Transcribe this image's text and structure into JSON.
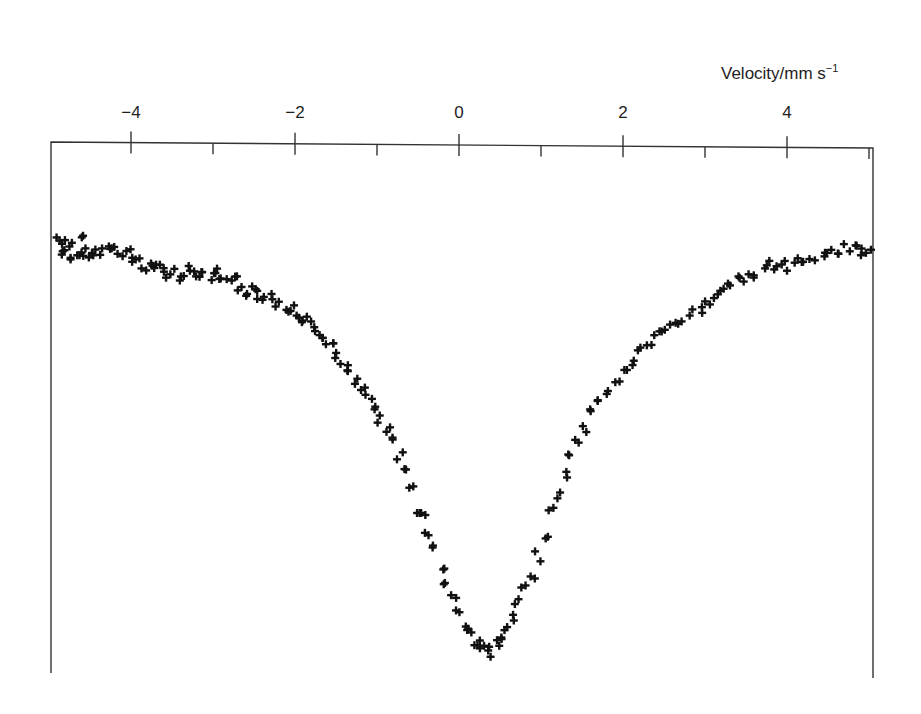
{
  "chart_data": {
    "type": "scatter",
    "title": "",
    "xlabel": "Velocity/mm s",
    "xlabel_superscript": "−1",
    "ylabel": "",
    "xlim": [
      -4.97,
      5.05
    ],
    "ylim_relative_transmission": [
      0.885,
      1.025
    ],
    "grid": false,
    "legend": null,
    "marker": "+",
    "x_ticks_major": [
      -4,
      -2,
      0,
      2,
      4
    ],
    "x_tick_labels": [
      "−4",
      "−2",
      "0",
      "2",
      "4"
    ],
    "x_ticks_minor": [
      -3,
      -1,
      1,
      3,
      5
    ],
    "x_axis_position": "top",
    "y_axis_labels": "none (relative transmission, arbitrary units)",
    "series": [
      {
        "name": "Mössbauer spectrum (single absorption line)",
        "points": [
          [
            -4.87,
            1.0
          ],
          [
            -4.8,
            1.0
          ],
          [
            -4.73,
            0.999
          ],
          [
            -4.6,
            1.0
          ],
          [
            -4.85,
            0.996
          ],
          [
            -4.78,
            0.996
          ],
          [
            -4.7,
            0.995
          ],
          [
            -4.62,
            0.996
          ],
          [
            -4.55,
            0.997
          ],
          [
            -4.48,
            0.996
          ],
          [
            -4.42,
            0.997
          ],
          [
            -4.35,
            0.997
          ],
          [
            -4.28,
            0.998
          ],
          [
            -4.2,
            0.997
          ],
          [
            -4.12,
            0.996
          ],
          [
            -4.05,
            0.997
          ],
          [
            -3.98,
            0.995
          ],
          [
            -3.92,
            0.994
          ],
          [
            -3.85,
            0.993
          ],
          [
            -3.78,
            0.994
          ],
          [
            -3.7,
            0.992
          ],
          [
            -3.62,
            0.993
          ],
          [
            -3.55,
            0.991
          ],
          [
            -3.48,
            0.992
          ],
          [
            -3.4,
            0.99
          ],
          [
            -3.32,
            0.991
          ],
          [
            -3.25,
            0.992
          ],
          [
            -3.18,
            0.991
          ],
          [
            -3.1,
            0.99
          ],
          [
            -3.02,
            0.99
          ],
          [
            -2.95,
            0.991
          ],
          [
            -2.88,
            0.989
          ],
          [
            -2.8,
            0.988
          ],
          [
            -2.72,
            0.989
          ],
          [
            -2.65,
            0.987
          ],
          [
            -2.58,
            0.986
          ],
          [
            -2.5,
            0.987
          ],
          [
            -2.42,
            0.985
          ],
          [
            -2.35,
            0.984
          ],
          [
            -2.28,
            0.985
          ],
          [
            -2.2,
            0.983
          ],
          [
            -2.12,
            0.981
          ],
          [
            -2.05,
            0.982
          ],
          [
            -1.98,
            0.98
          ],
          [
            -1.92,
            0.979
          ],
          [
            -1.85,
            0.978
          ],
          [
            -1.78,
            0.976
          ],
          [
            -1.7,
            0.974
          ],
          [
            -1.62,
            0.973
          ],
          [
            -1.55,
            0.971
          ],
          [
            -1.48,
            0.968
          ],
          [
            -1.4,
            0.966
          ],
          [
            -1.33,
            0.965
          ],
          [
            -1.25,
            0.962
          ],
          [
            -1.18,
            0.959
          ],
          [
            -1.1,
            0.957
          ],
          [
            -1.02,
            0.954
          ],
          [
            -0.95,
            0.951
          ],
          [
            -0.88,
            0.948
          ],
          [
            -0.8,
            0.945
          ],
          [
            -0.72,
            0.941
          ],
          [
            -0.65,
            0.937
          ],
          [
            -0.58,
            0.933
          ],
          [
            -0.5,
            0.927
          ],
          [
            -0.44,
            0.925
          ],
          [
            -0.38,
            0.921
          ],
          [
            -0.3,
            0.916
          ],
          [
            -0.22,
            0.911
          ],
          [
            -0.15,
            0.907
          ],
          [
            -0.08,
            0.903
          ],
          [
            0.0,
            0.899
          ],
          [
            0.08,
            0.895
          ],
          [
            0.14,
            0.893
          ],
          [
            0.2,
            0.891
          ],
          [
            0.26,
            0.89
          ],
          [
            0.33,
            0.889
          ],
          [
            0.4,
            0.888
          ],
          [
            0.46,
            0.89
          ],
          [
            0.52,
            0.891
          ],
          [
            0.58,
            0.894
          ],
          [
            0.66,
            0.897
          ],
          [
            0.73,
            0.901
          ],
          [
            0.8,
            0.905
          ],
          [
            0.88,
            0.909
          ],
          [
            0.96,
            0.914
          ],
          [
            1.05,
            0.92
          ],
          [
            1.14,
            0.926
          ],
          [
            1.22,
            0.931
          ],
          [
            1.3,
            0.936
          ],
          [
            1.38,
            0.941
          ],
          [
            1.46,
            0.945
          ],
          [
            1.55,
            0.949
          ],
          [
            1.64,
            0.953
          ],
          [
            1.73,
            0.956
          ],
          [
            1.82,
            0.959
          ],
          [
            1.92,
            0.962
          ],
          [
            2.02,
            0.964
          ],
          [
            2.12,
            0.967
          ],
          [
            2.22,
            0.97
          ],
          [
            2.32,
            0.972
          ],
          [
            2.42,
            0.974
          ],
          [
            2.52,
            0.975
          ],
          [
            2.62,
            0.977
          ],
          [
            2.72,
            0.978
          ],
          [
            2.82,
            0.98
          ],
          [
            2.92,
            0.981
          ],
          [
            3.02,
            0.983
          ],
          [
            3.12,
            0.985
          ],
          [
            3.22,
            0.987
          ],
          [
            3.32,
            0.988
          ],
          [
            3.42,
            0.989
          ],
          [
            3.52,
            0.99
          ],
          [
            3.62,
            0.991
          ],
          [
            3.72,
            0.992
          ],
          [
            3.82,
            0.993
          ],
          [
            3.92,
            0.992
          ],
          [
            4.02,
            0.993
          ],
          [
            4.12,
            0.994
          ],
          [
            4.22,
            0.994
          ],
          [
            4.32,
            0.995
          ],
          [
            4.42,
            0.996
          ],
          [
            4.52,
            0.996
          ],
          [
            4.62,
            0.997
          ],
          [
            4.72,
            0.998
          ],
          [
            4.82,
            0.998
          ],
          [
            4.92,
            0.997
          ],
          [
            4.98,
            0.996
          ]
        ]
      }
    ],
    "annotations": [
      {
        "text": "absorption minimum",
        "x": 0.4,
        "approx": true
      }
    ]
  },
  "axis": {
    "title_main": "Velocity/mm s",
    "title_sup": "−1"
  }
}
